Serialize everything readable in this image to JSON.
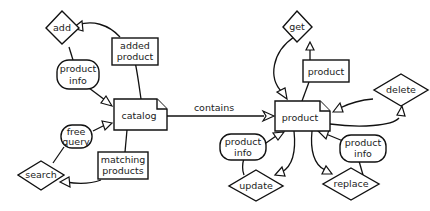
{
  "diagram": {
    "type": "resource-operation diagram",
    "resources": {
      "catalog": {
        "label": "catalog"
      },
      "product": {
        "label": "product"
      }
    },
    "relationship": {
      "label": "contains",
      "from": "catalog",
      "to": "product"
    },
    "catalog_operations": {
      "add": {
        "label": "add",
        "input": "product info",
        "output": "added product"
      },
      "search": {
        "label": "search",
        "input": "free query",
        "output": "matching products"
      }
    },
    "product_operations": {
      "get": {
        "label": "get",
        "output": "product"
      },
      "delete": {
        "label": "delete"
      },
      "update": {
        "label": "update",
        "input": "product info"
      },
      "replace": {
        "label": "replace",
        "input": "product info"
      }
    },
    "messages": {
      "add_input_line1": "product",
      "add_input_line2": "info",
      "add_output_line1": "added",
      "add_output_line2": "product",
      "search_input_line1": "free",
      "search_input_line2": "query",
      "search_output_line1": "matching",
      "search_output_line2": "products",
      "get_output": "product",
      "update_input_line1": "product",
      "update_input_line2": "info",
      "replace_input_line1": "product",
      "replace_input_line2": "info"
    },
    "colors": {
      "stroke": "#111111",
      "fill": "#ffffff",
      "text": "#222222"
    }
  }
}
